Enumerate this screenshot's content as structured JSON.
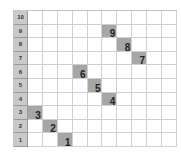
{
  "grid": {
    "rows": 10,
    "data_columns": 10,
    "row_labels": [
      "10",
      "9",
      "8",
      "7",
      "6",
      "5",
      "4",
      "3",
      "2",
      "1"
    ],
    "label_color": "#c9c9c9",
    "highlight_color": "#a6a6a6",
    "highlights": [
      {
        "row": 1,
        "col": 3,
        "label": "1"
      },
      {
        "row": 2,
        "col": 2,
        "label": "2"
      },
      {
        "row": 3,
        "col": 1,
        "label": "3"
      },
      {
        "row": 4,
        "col": 6,
        "label": "4"
      },
      {
        "row": 5,
        "col": 5,
        "label": "5"
      },
      {
        "row": 6,
        "col": 4,
        "label": "6"
      },
      {
        "row": 7,
        "col": 8,
        "label": "7"
      },
      {
        "row": 8,
        "col": 7,
        "label": "8"
      },
      {
        "row": 9,
        "col": 6,
        "label": "9"
      }
    ]
  }
}
